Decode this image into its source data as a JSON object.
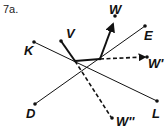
{
  "problem_label": "7a.",
  "points": {
    "K": {
      "label": "K",
      "x": 34,
      "y": 42
    },
    "L": {
      "label": "L",
      "x": 157,
      "y": 101
    },
    "D": {
      "label": "D",
      "x": 35,
      "y": 104
    },
    "E": {
      "label": "E",
      "x": 145,
      "y": 26
    },
    "V": {
      "label": "V",
      "x": 61,
      "y": 41
    },
    "W": {
      "label": "W",
      "x": 115,
      "y": 16
    },
    "W1": {
      "label": "W'",
      "x": 147,
      "y": 57
    },
    "W2": {
      "label": "W''",
      "x": 112,
      "y": 118
    }
  },
  "colors": {
    "stroke": "#111111",
    "background": "#ffffff"
  }
}
